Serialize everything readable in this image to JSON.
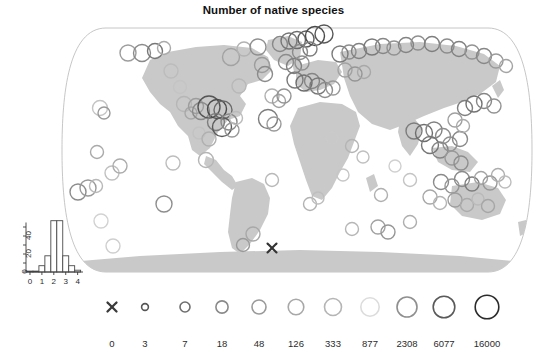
{
  "title": "Number of native species",
  "chart_data": {
    "type": "scatter",
    "title": "Number of native species",
    "subtitle": "",
    "xlabel": "",
    "ylabel": "",
    "projection": "world-map",
    "map": {
      "land_color": "#c9c9c9",
      "ocean_color": "#ffffff",
      "border_color": "#b8b8b8"
    },
    "marker_encoding": {
      "shape": "open-circle",
      "size_encodes": "number of native species",
      "color_encodes": "number of native species",
      "zero_marker": "x"
    },
    "legend": {
      "position": "bottom",
      "labels": [
        "0",
        "3",
        "7",
        "18",
        "48",
        "126",
        "333",
        "877",
        "2308",
        "6077",
        "16000"
      ],
      "values": [
        0,
        3,
        7,
        18,
        48,
        126,
        333,
        877,
        2308,
        6077,
        16000
      ],
      "symbols": [
        "x",
        "circle",
        "circle",
        "circle",
        "circle",
        "circle",
        "circle",
        "circle",
        "circle",
        "circle",
        "circle"
      ],
      "radii": [
        4.5,
        3.4,
        5.0,
        6.1,
        7.0,
        7.8,
        8.5,
        9.2,
        10.0,
        10.8,
        11.8
      ],
      "colors": [
        "#3a3a3a",
        "#555555",
        "#6e6e6e",
        "#8a8a8a",
        "#9a9a9a",
        "#a8a8a8",
        "#b5b5b5",
        "#dcdcdc",
        "#8f8f8f",
        "#5a5a5a",
        "#2b2b2b"
      ],
      "x_positions": [
        112,
        145,
        185,
        222,
        259,
        296,
        333,
        370,
        407,
        444,
        487
      ],
      "label_y": 338,
      "symbol_y": 307
    },
    "inset_histogram": {
      "type": "bar",
      "title": "",
      "xlabel": "",
      "ylabel": "",
      "xlim": [
        -0.25,
        4.45
      ],
      "ylim": [
        0,
        60
      ],
      "xticks": [
        0,
        1,
        2,
        3,
        4
      ],
      "xticklabels": [
        "0",
        "1",
        "2",
        "3",
        "4"
      ],
      "yticks": [
        0,
        20,
        40
      ],
      "yticklabels": [
        "0",
        "20",
        "40"
      ],
      "bin_width": 0.5,
      "bin_starts": [
        -0.25,
        0.25,
        0.75,
        1.25,
        1.75,
        2.25,
        2.75,
        3.25,
        3.75
      ],
      "values": [
        1,
        1,
        7,
        18,
        57,
        57,
        18,
        7,
        2
      ],
      "bar_fill": "#ffffff",
      "bar_stroke": "#4a4a4a",
      "grid": false
    },
    "points": [
      {
        "x": 128,
        "y": 53,
        "r": 8.0,
        "c": "#9d9d9d"
      },
      {
        "x": 142,
        "y": 53,
        "r": 8.5,
        "c": "#8a8a8a"
      },
      {
        "x": 155,
        "y": 51,
        "r": 7.5,
        "c": "#777777"
      },
      {
        "x": 164,
        "y": 48,
        "r": 6.5,
        "c": "#aaaaaa"
      },
      {
        "x": 100,
        "y": 108,
        "r": 7.5,
        "c": "#c4c4c4"
      },
      {
        "x": 104,
        "y": 113,
        "r": 6.0,
        "c": "#9a9a9a"
      },
      {
        "x": 97,
        "y": 152,
        "r": 6.5,
        "c": "#aaaaaa"
      },
      {
        "x": 78,
        "y": 192,
        "r": 8.0,
        "c": "#8c8c8c"
      },
      {
        "x": 88,
        "y": 188,
        "r": 8.0,
        "c": "#999999"
      },
      {
        "x": 96,
        "y": 186,
        "r": 6.5,
        "c": "#b8b8b8"
      },
      {
        "x": 112,
        "y": 173,
        "r": 7.0,
        "c": "#c0c0c0"
      },
      {
        "x": 120,
        "y": 166,
        "r": 7.0,
        "c": "#acacac"
      },
      {
        "x": 101,
        "y": 221,
        "r": 7.0,
        "c": "#d2d2d2"
      },
      {
        "x": 164,
        "y": 204,
        "r": 8.0,
        "c": "#8e8e8e"
      },
      {
        "x": 173,
        "y": 163,
        "r": 7.0,
        "c": "#bdbdbd"
      },
      {
        "x": 184,
        "y": 104,
        "r": 7.5,
        "c": "#b6b6b6"
      },
      {
        "x": 191,
        "y": 113,
        "r": 6.0,
        "c": "#a7a7a7"
      },
      {
        "x": 196,
        "y": 106,
        "r": 7.5,
        "c": "#9d9d9d"
      },
      {
        "x": 201,
        "y": 111,
        "r": 8.5,
        "c": "#8a8a8a"
      },
      {
        "x": 199,
        "y": 133,
        "r": 6.0,
        "c": "#c2c2c2"
      },
      {
        "x": 209,
        "y": 139,
        "r": 7.0,
        "c": "#b0b0b0"
      },
      {
        "x": 209,
        "y": 107,
        "r": 11.0,
        "c": "#555555"
      },
      {
        "x": 217,
        "y": 109,
        "r": 9.5,
        "c": "#4a4a4a"
      },
      {
        "x": 223,
        "y": 110,
        "r": 9.0,
        "c": "#6a6a6a"
      },
      {
        "x": 216,
        "y": 122,
        "r": 8.5,
        "c": "#7d7d7d"
      },
      {
        "x": 222,
        "y": 127,
        "r": 9.5,
        "c": "#5a5a5a"
      },
      {
        "x": 229,
        "y": 122,
        "r": 8.0,
        "c": "#8a8a8a"
      },
      {
        "x": 232,
        "y": 130,
        "r": 7.0,
        "c": "#999999"
      },
      {
        "x": 236,
        "y": 118,
        "r": 6.5,
        "c": "#bbbbbb"
      },
      {
        "x": 206,
        "y": 160,
        "r": 7.5,
        "c": "#b5b5b5"
      },
      {
        "x": 231,
        "y": 57,
        "r": 8.5,
        "c": "#a2a2a2"
      },
      {
        "x": 244,
        "y": 49,
        "r": 7.0,
        "c": "#b2b2b2"
      },
      {
        "x": 258,
        "y": 47,
        "r": 8.0,
        "c": "#8f8f8f"
      },
      {
        "x": 262,
        "y": 65,
        "r": 7.5,
        "c": "#9d9d9d"
      },
      {
        "x": 265,
        "y": 74,
        "r": 7.5,
        "c": "#8a8a8a"
      },
      {
        "x": 268,
        "y": 119,
        "r": 9.5,
        "c": "#7d7d7d"
      },
      {
        "x": 274,
        "y": 124,
        "r": 7.0,
        "c": "#999999"
      },
      {
        "x": 272,
        "y": 180,
        "r": 6.5,
        "c": "#b8b8b8"
      },
      {
        "x": 253,
        "y": 234,
        "r": 7.0,
        "c": "#a8a8a8"
      },
      {
        "x": 280,
        "y": 44,
        "r": 7.5,
        "c": "#888888"
      },
      {
        "x": 289,
        "y": 41,
        "r": 8.0,
        "c": "#767676"
      },
      {
        "x": 297,
        "y": 40,
        "r": 8.5,
        "c": "#6a6a6a"
      },
      {
        "x": 306,
        "y": 39,
        "r": 8.0,
        "c": "#5e5e5e"
      },
      {
        "x": 315,
        "y": 36,
        "r": 9.5,
        "c": "#4a4a4a"
      },
      {
        "x": 324,
        "y": 34,
        "r": 9.0,
        "c": "#585858"
      },
      {
        "x": 300,
        "y": 52,
        "r": 7.5,
        "c": "#8a8a8a"
      },
      {
        "x": 310,
        "y": 49,
        "r": 7.0,
        "c": "#7e7e7e"
      },
      {
        "x": 286,
        "y": 62,
        "r": 7.5,
        "c": "#8c8c8c"
      },
      {
        "x": 294,
        "y": 66,
        "r": 7.5,
        "c": "#7f7f7f"
      },
      {
        "x": 302,
        "y": 63,
        "r": 7.0,
        "c": "#909090"
      },
      {
        "x": 295,
        "y": 80,
        "r": 8.0,
        "c": "#7a7a7a"
      },
      {
        "x": 304,
        "y": 83,
        "r": 8.0,
        "c": "#6e6e6e"
      },
      {
        "x": 312,
        "y": 81,
        "r": 7.5,
        "c": "#858585"
      },
      {
        "x": 318,
        "y": 86,
        "r": 8.0,
        "c": "#797979"
      },
      {
        "x": 325,
        "y": 90,
        "r": 7.5,
        "c": "#8c8c8c"
      },
      {
        "x": 333,
        "y": 88,
        "r": 7.0,
        "c": "#9a9a9a"
      },
      {
        "x": 272,
        "y": 96,
        "r": 7.0,
        "c": "#b0b0b0"
      },
      {
        "x": 279,
        "y": 101,
        "r": 6.5,
        "c": "#a0a0a0"
      },
      {
        "x": 284,
        "y": 96,
        "r": 7.0,
        "c": "#949494"
      },
      {
        "x": 340,
        "y": 54,
        "r": 8.0,
        "c": "#7b7b7b"
      },
      {
        "x": 349,
        "y": 52,
        "r": 7.0,
        "c": "#8d8d8d"
      },
      {
        "x": 359,
        "y": 51,
        "r": 7.5,
        "c": "#828282"
      },
      {
        "x": 345,
        "y": 70,
        "r": 7.0,
        "c": "#a2a2a2"
      },
      {
        "x": 355,
        "y": 74,
        "r": 7.0,
        "c": "#959595"
      },
      {
        "x": 364,
        "y": 72,
        "r": 6.5,
        "c": "#a8a8a8"
      },
      {
        "x": 372,
        "y": 47,
        "r": 8.0,
        "c": "#7a7a7a"
      },
      {
        "x": 383,
        "y": 46,
        "r": 7.5,
        "c": "#868686"
      },
      {
        "x": 394,
        "y": 48,
        "r": 7.0,
        "c": "#919191"
      },
      {
        "x": 406,
        "y": 45,
        "r": 7.5,
        "c": "#838383"
      },
      {
        "x": 418,
        "y": 43,
        "r": 7.0,
        "c": "#8f8f8f"
      },
      {
        "x": 432,
        "y": 44,
        "r": 7.5,
        "c": "#7e7e7e"
      },
      {
        "x": 447,
        "y": 46,
        "r": 7.0,
        "c": "#8c8c8c"
      },
      {
        "x": 459,
        "y": 49,
        "r": 7.5,
        "c": "#818181"
      },
      {
        "x": 472,
        "y": 52,
        "r": 7.0,
        "c": "#939393"
      },
      {
        "x": 484,
        "y": 56,
        "r": 7.5,
        "c": "#878787"
      },
      {
        "x": 496,
        "y": 61,
        "r": 7.0,
        "c": "#9a9a9a"
      },
      {
        "x": 506,
        "y": 66,
        "r": 6.5,
        "c": "#a4a4a4"
      },
      {
        "x": 414,
        "y": 131,
        "r": 8.0,
        "c": "#7c7c7c"
      },
      {
        "x": 424,
        "y": 133,
        "r": 8.5,
        "c": "#6e6e6e"
      },
      {
        "x": 434,
        "y": 130,
        "r": 8.0,
        "c": "#828282"
      },
      {
        "x": 443,
        "y": 136,
        "r": 7.5,
        "c": "#8e8e8e"
      },
      {
        "x": 430,
        "y": 145,
        "r": 8.5,
        "c": "#767676"
      },
      {
        "x": 440,
        "y": 150,
        "r": 8.0,
        "c": "#848484"
      },
      {
        "x": 450,
        "y": 144,
        "r": 7.0,
        "c": "#919191"
      },
      {
        "x": 460,
        "y": 139,
        "r": 7.5,
        "c": "#888888"
      },
      {
        "x": 452,
        "y": 158,
        "r": 7.0,
        "c": "#9a9a9a"
      },
      {
        "x": 461,
        "y": 163,
        "r": 7.0,
        "c": "#8d8d8d"
      },
      {
        "x": 410,
        "y": 180,
        "r": 6.5,
        "c": "#c4c4c4"
      },
      {
        "x": 395,
        "y": 166,
        "r": 6.0,
        "c": "#d0d0d0"
      },
      {
        "x": 465,
        "y": 108,
        "r": 7.5,
        "c": "#7f7f7f"
      },
      {
        "x": 474,
        "y": 104,
        "r": 8.0,
        "c": "#737373"
      },
      {
        "x": 484,
        "y": 101,
        "r": 7.5,
        "c": "#868686"
      },
      {
        "x": 494,
        "y": 106,
        "r": 7.0,
        "c": "#929292"
      },
      {
        "x": 455,
        "y": 120,
        "r": 7.0,
        "c": "#a0a0a0"
      },
      {
        "x": 463,
        "y": 126,
        "r": 6.5,
        "c": "#aaaaaa"
      },
      {
        "x": 441,
        "y": 182,
        "r": 7.5,
        "c": "#8a8a8a"
      },
      {
        "x": 452,
        "y": 186,
        "r": 7.0,
        "c": "#969696"
      },
      {
        "x": 462,
        "y": 179,
        "r": 7.5,
        "c": "#8b8b8b"
      },
      {
        "x": 472,
        "y": 184,
        "r": 7.0,
        "c": "#7d7d7d"
      },
      {
        "x": 481,
        "y": 178,
        "r": 6.5,
        "c": "#a5a5a5"
      },
      {
        "x": 490,
        "y": 183,
        "r": 7.0,
        "c": "#989898"
      },
      {
        "x": 498,
        "y": 175,
        "r": 6.5,
        "c": "#adadad"
      },
      {
        "x": 505,
        "y": 182,
        "r": 6.0,
        "c": "#bdbdbd"
      },
      {
        "x": 430,
        "y": 197,
        "r": 7.0,
        "c": "#a8a8a8"
      },
      {
        "x": 440,
        "y": 203,
        "r": 6.5,
        "c": "#b4b4b4"
      },
      {
        "x": 455,
        "y": 200,
        "r": 7.0,
        "c": "#9e9e9e"
      },
      {
        "x": 467,
        "y": 205,
        "r": 6.5,
        "c": "#ababab"
      },
      {
        "x": 478,
        "y": 199,
        "r": 6.0,
        "c": "#bababa"
      },
      {
        "x": 488,
        "y": 206,
        "r": 6.5,
        "c": "#a6a6a6"
      },
      {
        "x": 381,
        "y": 195,
        "r": 6.5,
        "c": "#b0b0b0"
      },
      {
        "x": 378,
        "y": 227,
        "r": 7.0,
        "c": "#a2a2a2"
      },
      {
        "x": 388,
        "y": 232,
        "r": 7.0,
        "c": "#969696"
      },
      {
        "x": 352,
        "y": 229,
        "r": 6.5,
        "c": "#b6b6b6"
      },
      {
        "x": 410,
        "y": 222,
        "r": 6.5,
        "c": "#aeaeae"
      },
      {
        "x": 343,
        "y": 175,
        "r": 6.0,
        "c": "#c6c6c6"
      },
      {
        "x": 363,
        "y": 157,
        "r": 6.0,
        "c": "#c0c0c0"
      },
      {
        "x": 352,
        "y": 146,
        "r": 6.5,
        "c": "#b4b4b4"
      },
      {
        "x": 332,
        "y": 138,
        "r": 6.0,
        "c": "#cacaca"
      },
      {
        "x": 310,
        "y": 204,
        "r": 6.5,
        "c": "#b2b2b2"
      },
      {
        "x": 318,
        "y": 198,
        "r": 6.0,
        "c": "#bebebe"
      },
      {
        "x": 243,
        "y": 245,
        "r": 6.5,
        "c": "#9a9a9a"
      },
      {
        "x": 113,
        "y": 246,
        "r": 7.0,
        "c": "#cfcfcf"
      },
      {
        "x": 239,
        "y": 86,
        "r": 7.0,
        "c": "#b8b8b8"
      },
      {
        "x": 180,
        "y": 87,
        "r": 6.5,
        "c": "#c4c4c4"
      },
      {
        "x": 171,
        "y": 71,
        "r": 7.0,
        "c": "#bcbcbc"
      }
    ],
    "x_markers": [
      {
        "x": 272,
        "y": 248
      }
    ]
  }
}
